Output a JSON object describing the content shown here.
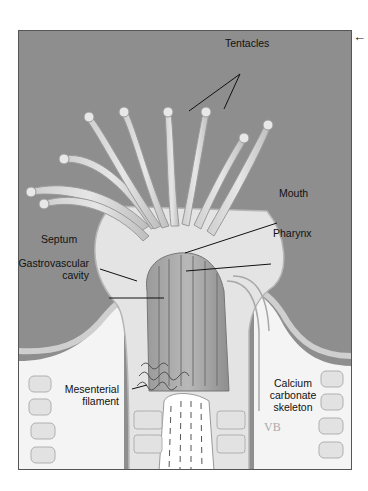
{
  "figure": {
    "nav_icon": "arrow-left-icon",
    "colors": {
      "water_background": "#8e8e8e",
      "tissue": "#d9d9d9",
      "skeleton": "#f4f4f4",
      "frame": "#555555"
    },
    "labels": {
      "tentacles": "Tentacles",
      "mouth": "Mouth",
      "pharynx": "Pharynx",
      "septum": "Septum",
      "gastrovascular_line1": "Gastrovascular",
      "gastrovascular_line2": "cavity",
      "mesenterial_line1": "Mesenterial",
      "mesenterial_line2": "filament",
      "calcium_line1": "Calcium",
      "calcium_line2": "carbonate",
      "calcium_line3": "skeleton"
    },
    "signature": "VB"
  }
}
